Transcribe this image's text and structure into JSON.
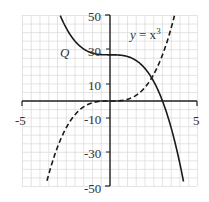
{
  "chart_data": {
    "type": "line",
    "title": "",
    "xlabel": "",
    "ylabel": "",
    "xlim": [
      -5,
      5
    ],
    "ylim": [
      -50,
      50
    ],
    "grid": true,
    "x_tick_labels": [
      "-5",
      "5"
    ],
    "y_tick_labels": [
      "50",
      "30",
      "10",
      "-10",
      "-30",
      "-50"
    ],
    "series": [
      {
        "name": "y = x^3",
        "label": "y = x³",
        "style": "dashed",
        "formula": "x^3",
        "x": [
          -3.68,
          -3,
          -2,
          -1,
          0,
          1,
          2,
          3,
          3.68
        ],
        "y": [
          -50,
          -27,
          -8,
          -1,
          0,
          1,
          8,
          27,
          50
        ]
      },
      {
        "name": "Q",
        "label": "Q",
        "style": "solid",
        "formula": "27 - x^3",
        "x": [
          -2.84,
          -2,
          -1,
          0,
          1,
          2,
          3,
          4.2
        ],
        "y": [
          50,
          35,
          28,
          27,
          26,
          19,
          0,
          -47
        ]
      }
    ],
    "annotations": [
      "Q",
      "y = x³"
    ]
  },
  "labels": {
    "x_min": "-5",
    "x_max": "5",
    "y_50": "50",
    "y_30": "30",
    "y_10": "10",
    "y_m10": "-10",
    "y_m30": "-30",
    "y_m50": "-50",
    "curve_q": "Q",
    "curve_cubic_y": "y",
    "curve_cubic_eq": " = x",
    "curve_cubic_exp": "3"
  },
  "colors": {
    "axis": "#222222",
    "grid": "#d9d9d9",
    "curve": "#1a1a1a"
  }
}
